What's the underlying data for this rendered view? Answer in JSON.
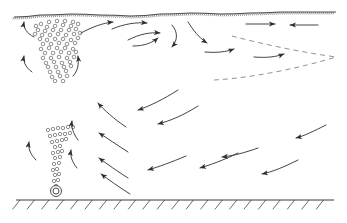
{
  "figure": {
    "type": "schematic-diagram",
    "width": 347,
    "height": 223,
    "background_color": "#ffffff",
    "line_color": "#3a3a3a",
    "bubble_color": "#6b6b6b",
    "dashed_color": "#8c8c8c"
  },
  "free_surface": {
    "label": "free-surface",
    "style": "hatched-wavy-line",
    "y_left": 17,
    "y_right": 12,
    "x_start": 14,
    "x_end": 336,
    "tick_count": 160,
    "points": [
      [
        14,
        17
      ],
      [
        40,
        15
      ],
      [
        70,
        14
      ],
      [
        100,
        15
      ],
      [
        130,
        16
      ],
      [
        160,
        14
      ],
      [
        190,
        13
      ],
      [
        220,
        14
      ],
      [
        250,
        13
      ],
      [
        280,
        12
      ],
      [
        310,
        12
      ],
      [
        336,
        12
      ]
    ]
  },
  "bottom_wall": {
    "label": "tank-bottom-wall",
    "style": "hatched-ground-line",
    "y": 200,
    "x_start": 16,
    "x_end": 334,
    "hatch_count": 22,
    "hatch_length": 12,
    "hatch_angle_deg": 45
  },
  "nozzle": {
    "label": "gas-diffuser-nozzle",
    "cx": 56,
    "cy": 191,
    "outer_radius": 5.5,
    "inner_radius": 3.0
  },
  "plumes": [
    {
      "name": "upper-bubble-plume",
      "description": "wide inverted-cone bubble cloud spreading below the free surface",
      "bubble_radius": 1.8,
      "bubbles": [
        [
          41,
          24
        ],
        [
          49,
          22
        ],
        [
          57,
          21
        ],
        [
          65,
          21
        ],
        [
          73,
          22
        ],
        [
          47,
          27
        ],
        [
          55,
          26
        ],
        [
          63,
          25
        ],
        [
          71,
          26
        ],
        [
          38,
          30
        ],
        [
          45,
          31
        ],
        [
          53,
          30
        ],
        [
          61,
          30
        ],
        [
          69,
          30
        ],
        [
          76,
          29
        ],
        [
          42,
          35
        ],
        [
          50,
          35
        ],
        [
          58,
          34
        ],
        [
          66,
          35
        ],
        [
          74,
          34
        ],
        [
          40,
          39
        ],
        [
          47,
          40
        ],
        [
          55,
          39
        ],
        [
          63,
          39
        ],
        [
          71,
          40
        ],
        [
          78,
          38
        ],
        [
          43,
          44
        ],
        [
          51,
          44
        ],
        [
          59,
          43
        ],
        [
          67,
          44
        ],
        [
          75,
          43
        ],
        [
          41,
          49
        ],
        [
          49,
          48
        ],
        [
          57,
          48
        ],
        [
          65,
          48
        ],
        [
          73,
          49
        ],
        [
          45,
          53
        ],
        [
          53,
          53
        ],
        [
          61,
          52
        ],
        [
          69,
          53
        ],
        [
          76,
          52
        ],
        [
          43,
          58
        ],
        [
          51,
          58
        ],
        [
          59,
          57
        ],
        [
          67,
          58
        ],
        [
          74,
          57
        ],
        [
          46,
          63
        ],
        [
          54,
          62
        ],
        [
          62,
          63
        ],
        [
          70,
          62
        ],
        [
          48,
          67
        ],
        [
          56,
          67
        ],
        [
          64,
          67
        ],
        [
          71,
          66
        ],
        [
          50,
          72
        ],
        [
          58,
          72
        ],
        [
          66,
          71
        ],
        [
          52,
          77
        ],
        [
          60,
          76
        ],
        [
          67,
          76
        ],
        [
          55,
          81
        ],
        [
          63,
          81
        ],
        [
          36,
          26
        ],
        [
          35,
          34
        ],
        [
          78,
          24
        ],
        [
          80,
          33
        ]
      ]
    },
    {
      "name": "lower-bubble-plume",
      "description": "narrow bubble column rising from the nozzle",
      "bubble_radius": 1.7,
      "bubbles": [
        [
          56,
          186
        ],
        [
          54,
          181
        ],
        [
          58,
          180
        ],
        [
          55,
          175
        ],
        [
          59,
          174
        ],
        [
          53,
          170
        ],
        [
          57,
          169
        ],
        [
          54,
          164
        ],
        [
          59,
          163
        ],
        [
          55,
          158
        ],
        [
          60,
          157
        ],
        [
          53,
          153
        ],
        [
          58,
          152
        ],
        [
          62,
          151
        ],
        [
          55,
          147
        ],
        [
          60,
          146
        ],
        [
          52,
          142
        ],
        [
          57,
          141
        ],
        [
          62,
          140
        ],
        [
          66,
          139
        ],
        [
          50,
          136
        ],
        [
          55,
          135
        ],
        [
          60,
          134
        ],
        [
          65,
          134
        ],
        [
          70,
          133
        ],
        [
          48,
          130
        ],
        [
          53,
          129
        ],
        [
          58,
          128
        ],
        [
          63,
          128
        ],
        [
          68,
          127
        ],
        [
          73,
          127
        ]
      ]
    }
  ],
  "dashed_curves": [
    {
      "name": "upper-separatrix",
      "description": "dashed boundary curve sloping down-right to the cusp",
      "path": "M 232,36 C 262,44 300,52 336,57"
    },
    {
      "name": "lower-separatrix",
      "description": "dashed boundary curve sweeping up-right to the cusp",
      "path": "M 214,80 C 252,78 300,68 336,57"
    }
  ],
  "flow_arrows": [
    {
      "name": "arrow-upper-left-inflow",
      "path": "M 34,37 C 26,33 23,27 24,22",
      "direction": "up-left"
    },
    {
      "name": "arrow-upper-left-return",
      "path": "M 32,72 C 25,67 23,61 24,56",
      "direction": "up-left"
    },
    {
      "name": "arrow-plume-top-right",
      "path": "M 73,76 C 78,71 79,64 78,56",
      "direction": "up"
    },
    {
      "name": "arrow-surface-out-1",
      "path": "M 81,33 C 92,27 103,23 113,22",
      "direction": "right"
    },
    {
      "name": "arrow-surface-out-2",
      "path": "M 112,29 C 124,24 136,22 147,23",
      "direction": "right"
    },
    {
      "name": "arrow-mid-right-1",
      "path": "M 128,40 C 140,34 150,32 160,33",
      "direction": "right"
    },
    {
      "name": "arrow-descend-1",
      "path": "M 172,25 C 178,32 178,40 172,47",
      "direction": "down-left"
    },
    {
      "name": "arrow-descend-2",
      "path": "M 133,46 C 144,46 152,43 158,38",
      "direction": "down-right"
    },
    {
      "name": "arrow-surface-crest",
      "path": "M 188,22 C 193,30 199,38 207,43",
      "direction": "down-right"
    },
    {
      "name": "arrow-mid-right-2",
      "path": "M 205,52 C 216,53 226,52 234,49",
      "direction": "right"
    },
    {
      "name": "arrow-mid-right-3",
      "path": "M 254,57 C 266,58 276,57 284,54",
      "direction": "right"
    },
    {
      "name": "arrow-top-right-inward-1",
      "path": "M 246,24 L 275,24",
      "direction": "right",
      "style": "straight"
    },
    {
      "name": "arrow-top-right-inward-2",
      "path": "M 318,25 L 290,25",
      "direction": "left",
      "style": "straight"
    },
    {
      "name": "arrow-return-mid-1",
      "path": "M 178,90 C 164,99 150,106 138,110",
      "direction": "left"
    },
    {
      "name": "arrow-return-mid-2",
      "path": "M 198,106 C 184,115 170,121 158,124",
      "direction": "left"
    },
    {
      "name": "arrow-recirc-up-1",
      "path": "M 126,127 C 114,119 104,110 98,103",
      "direction": "up-left"
    },
    {
      "name": "arrow-recirc-up-2",
      "path": "M 128,152 C 117,145 107,138 99,133",
      "direction": "up-left"
    },
    {
      "name": "arrow-recirc-up-3",
      "path": "M 128,178 C 117,171 107,164 99,158",
      "direction": "up-left"
    },
    {
      "name": "arrow-recirc-up-4",
      "path": "M 130,194 C 119,187 109,180 101,174",
      "direction": "up-left"
    },
    {
      "name": "arrow-lower-return-1",
      "path": "M 186,156 C 172,162 158,167 148,170",
      "direction": "left"
    },
    {
      "name": "arrow-lower-return-2",
      "path": "M 238,153 C 224,160 210,165 200,168",
      "direction": "left"
    },
    {
      "name": "arrow-lower-return-3",
      "path": "M 258,148 C 244,153 232,156 222,157",
      "direction": "left"
    },
    {
      "name": "arrow-lower-return-4",
      "path": "M 298,160 C 284,167 272,172 262,174",
      "direction": "left"
    },
    {
      "name": "arrow-right-return-1",
      "path": "M 326,125 C 314,131 304,136 296,138",
      "direction": "left"
    },
    {
      "name": "arrow-plume-feed-mid",
      "path": "M 78,140 C 73,133 71,127 72,121",
      "direction": "up"
    },
    {
      "name": "arrow-plume-feed-low",
      "path": "M 77,168 C 72,162 70,156 71,150",
      "direction": "up"
    },
    {
      "name": "arrow-left-wall-up",
      "path": "M 36,160 C 30,154 28,148 29,142",
      "direction": "up-left"
    }
  ]
}
